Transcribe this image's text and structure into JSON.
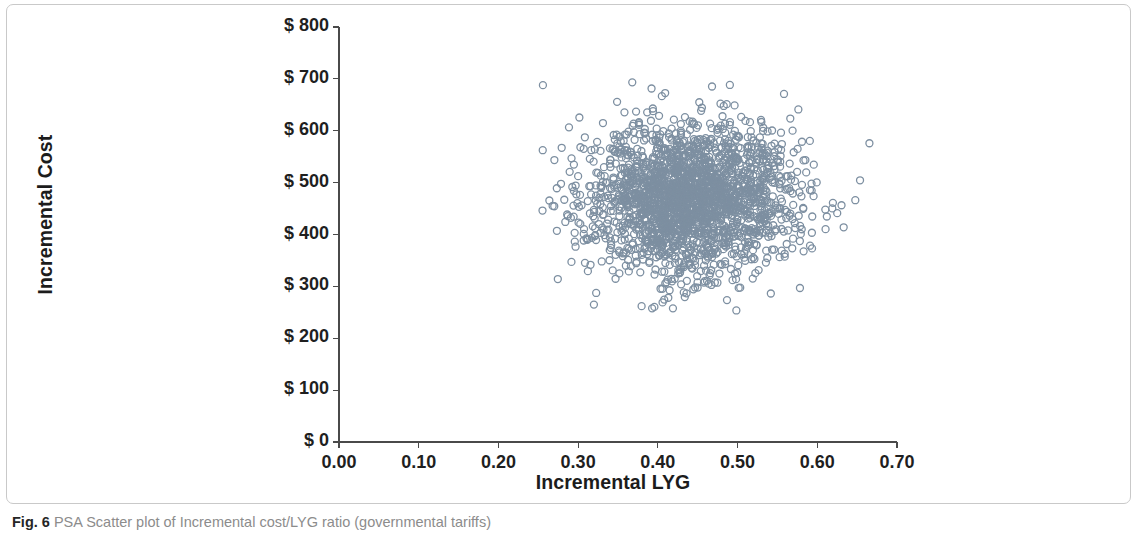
{
  "figure": {
    "caption_label": "Fig. 6",
    "caption_text": "PSA Scatter plot of Incremental cost/LYG ratio (governmental tariffs)"
  },
  "chart_data": {
    "type": "scatter",
    "title": "",
    "xlabel": "Incremental LYG",
    "ylabel": "Incremental Cost",
    "xlim": [
      0.0,
      0.7
    ],
    "ylim": [
      0,
      800
    ],
    "grid": false,
    "legend": null,
    "x_ticks": [
      "0.00",
      "0.10",
      "0.20",
      "0.30",
      "0.40",
      "0.50",
      "0.60",
      "0.70"
    ],
    "x_tick_values": [
      0.0,
      0.1,
      0.2,
      0.3,
      0.4,
      0.5,
      0.6,
      0.7
    ],
    "y_ticks": [
      "$ 0",
      "$ 100",
      "$ 200",
      "$ 300",
      "$ 400",
      "$ 500",
      "$ 600",
      "$ 700",
      "$ 800"
    ],
    "y_tick_values": [
      0,
      100,
      200,
      300,
      400,
      500,
      600,
      700,
      800
    ],
    "marker": {
      "shape": "open-circle",
      "diameter_px": 7,
      "stroke_color": "#7d8fa1",
      "stroke_width_px": 1.3,
      "fill": "none"
    },
    "point_count": 2200,
    "cloud": {
      "center_x": 0.442,
      "center_y": 470,
      "sd_x": 0.063,
      "sd_y": 73,
      "x_range": [
        0.23,
        0.67
      ],
      "y_range": [
        240,
        722
      ],
      "correlation": 0.06
    },
    "series": [
      {
        "name": "PSA simulations",
        "marker_color": "#7d8fa1",
        "description": "Monte Carlo probabilistic sensitivity analysis draws of incremental cost vs incremental life-years gained, forming a dense elliptical cloud entirely in the north-east quadrant."
      }
    ]
  }
}
